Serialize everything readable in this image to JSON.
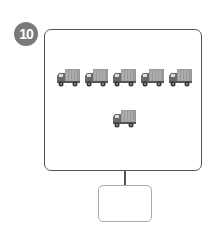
{
  "question": {
    "number": "10",
    "badge_color": "#7a7a7a"
  },
  "picture": {
    "icon": "truck-icon",
    "rows": [
      {
        "count": 5
      },
      {
        "count": 1
      }
    ],
    "total_trucks": 6
  },
  "answer": {
    "value": ""
  }
}
